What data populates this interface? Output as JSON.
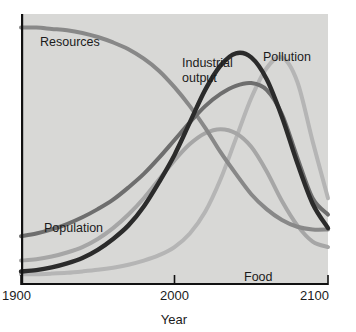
{
  "figure": {
    "background_color": "#ffffff",
    "plot_background_color": "#d8d8d6",
    "axis_color": "#111111",
    "text_color": "#1b1b1b"
  },
  "axes": {
    "x_axis_title": "Year",
    "x_tick_labels": [
      "1900",
      "2000",
      "2100"
    ],
    "x_tick_values": [
      1900,
      2000,
      2100
    ],
    "y_tick_labels": [],
    "y_axis_title": ""
  },
  "labels": {
    "resources": "Resources",
    "population": "Population",
    "industrial_output_line1": "Industrial",
    "industrial_output_line2": "output",
    "pollution": "Pollution",
    "food": "Food"
  },
  "chart_data": {
    "type": "line",
    "title": "",
    "subtitle": "",
    "xlabel": "Year",
    "ylabel": "",
    "xlim": [
      1900,
      2100
    ],
    "ylim": [
      0,
      100
    ],
    "grid": false,
    "legend": "inline-annotations",
    "x": [
      1900,
      1910,
      1920,
      1930,
      1940,
      1950,
      1960,
      1970,
      1980,
      1990,
      2000,
      2010,
      2020,
      2030,
      2040,
      2050,
      2060,
      2070,
      2080,
      2090,
      2100
    ],
    "series": [
      {
        "name": "Resources",
        "color": "#888888",
        "stroke_width": 4.0,
        "annotation": "Resources",
        "values": [
          95,
          95,
          94.5,
          94,
          93,
          91.5,
          89.5,
          87,
          83.5,
          79,
          73,
          66,
          58,
          49,
          41,
          33.5,
          28,
          24,
          21.5,
          20.5,
          20.5
        ]
      },
      {
        "name": "Population",
        "color": "#6e6e6e",
        "stroke_width": 4.0,
        "annotation": "Population",
        "values": [
          18,
          19,
          20.5,
          22.5,
          25,
          28,
          31.5,
          36,
          41,
          47,
          53.5,
          60,
          66,
          70.5,
          73.5,
          74.5,
          72,
          63,
          47,
          32,
          26
        ]
      },
      {
        "name": "Industrial output",
        "color": "#2b2b2b",
        "stroke_width": 4.4,
        "annotation": "Industrial output",
        "values": [
          5,
          5.5,
          6.5,
          8,
          10,
          13,
          17,
          22,
          29,
          38,
          48,
          60,
          72,
          81,
          85.5,
          84,
          76,
          62,
          45,
          30,
          21
        ]
      },
      {
        "name": "Food",
        "color": "#a6a6a6",
        "stroke_width": 4.0,
        "annotation": "Food",
        "values": [
          9,
          9.5,
          10.5,
          12,
          14,
          17,
          21,
          26,
          32,
          39,
          46,
          52,
          56,
          57.5,
          56,
          51,
          42,
          31,
          22,
          16,
          14
        ]
      },
      {
        "name": "Pollution",
        "color": "#b5b5b5",
        "stroke_width": 4.0,
        "annotation": "Pollution",
        "values": [
          4,
          4,
          4.2,
          4.5,
          5,
          5.6,
          6.4,
          7.5,
          9,
          11,
          14,
          19,
          27,
          39,
          54,
          69,
          80,
          84,
          75,
          53,
          32
        ]
      }
    ]
  },
  "geometry": {
    "plot_left_px": 21,
    "plot_right_px": 328,
    "plot_top_px": 14,
    "plot_bottom_px": 285
  }
}
